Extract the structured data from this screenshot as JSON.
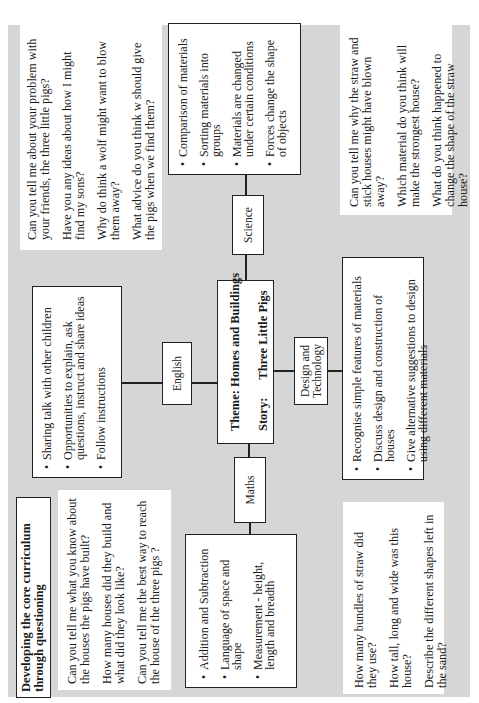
{
  "title": {
    "line1": "Developing the core curriculum",
    "line2": "through questioning"
  },
  "theme": {
    "theme_label": "Theme: Homes and Buildings",
    "story_label": "Story:",
    "story_value": "Three Little Pigs"
  },
  "subjects": {
    "english": {
      "label": "English",
      "items": [
        "Sharing talk with other children",
        "Opportunities to explain, ask questions, instruct and share ideas",
        "Follow instructions"
      ]
    },
    "science": {
      "label": "Science",
      "items": [
        "Comparison of materials",
        "Sorting materials into groups",
        "Materials are changed under certain conditions",
        "Forces change the shape of objects"
      ]
    },
    "maths": {
      "label": "Maths",
      "items": [
        "Addition and Subtraction",
        "Language of space and shape",
        "Measurement - height, length and breadth"
      ]
    },
    "dt": {
      "label_line1": "Design and",
      "label_line2": "Technology",
      "items": [
        "Recognise simple features of materials",
        "Discuss design and construction of houses",
        "Give alternative suggestions to design using different materials"
      ]
    }
  },
  "questions": {
    "english": [
      "Can you tell me about your problem with your friends, the three little pigs?",
      "Have you any ideas about how I might find my sons?",
      "Why do think a wolf might want to blow them away?",
      "What advice do you think w should give  the pigs when we find them?"
    ],
    "science": [
      "Can you tell me why the straw and stick houses might have blown away?",
      "Which material do you think will make the strongest house?",
      "What do you think happened to change the shape of the straw house?"
    ],
    "general": [
      "Can you tell me what you know about the houses the pigs have built?",
      "How many houses did they build and what did they look like?",
      "Can you tell me the best way to reach the house of the three pigs ?"
    ],
    "maths": [
      "How many bundles of straw did they use?",
      "How tall, long and wide was this house?",
      "Describe the different shapes left in the sand?"
    ]
  }
}
